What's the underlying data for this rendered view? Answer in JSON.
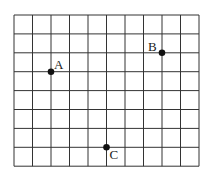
{
  "grid": {
    "columns": 10,
    "rows": 8,
    "origin_px": [
      14,
      15
    ],
    "cell_w": 18.5,
    "cell_h": 18.9,
    "line_color": "#333333"
  },
  "points": [
    {
      "label": "A",
      "col": 2,
      "row": 3,
      "label_dx": 3,
      "label_dy": -3
    },
    {
      "label": "B",
      "col": 8,
      "row": 2,
      "label_dx": -14,
      "label_dy": -2
    },
    {
      "label": "C",
      "col": 5,
      "row": 7,
      "label_dx": 3,
      "label_dy": 12
    }
  ]
}
